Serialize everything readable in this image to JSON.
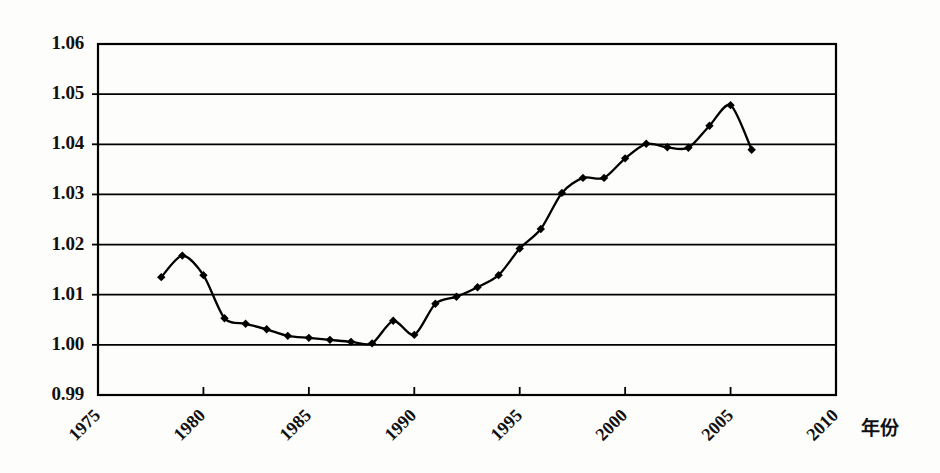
{
  "chart_data": {
    "type": "line",
    "title": "",
    "subtitle": "",
    "xlabel": "年份",
    "ylabel": "",
    "xlim": [
      1975,
      2010
    ],
    "ylim": [
      0.99,
      1.06
    ],
    "grid": true,
    "grid_axis": "y",
    "legend": null,
    "legend_position": "none",
    "marker": "diamond",
    "marker_color": "#000000",
    "line_color": "#000000",
    "x_tick_labels": [
      "1975",
      "1980",
      "1985",
      "1990",
      "1995",
      "2000",
      "2005",
      "2010"
    ],
    "x_ticks": [
      1975,
      1980,
      1985,
      1990,
      1995,
      2000,
      2005,
      2010
    ],
    "y_tick_labels": [
      "1.06",
      "1.05",
      "1.04",
      "1.03",
      "1.02",
      "1.01",
      "1.00",
      "0.99"
    ],
    "y_ticks": [
      1.06,
      1.05,
      1.04,
      1.03,
      1.02,
      1.01,
      1.0,
      0.99
    ],
    "x": [
      1978,
      1979,
      1980,
      1981,
      1982,
      1983,
      1984,
      1985,
      1986,
      1987,
      1988,
      1989,
      1990,
      1991,
      1992,
      1993,
      1994,
      1995,
      1996,
      1997,
      1998,
      1999,
      2000,
      2001,
      2002,
      2003,
      2004,
      2005,
      2006
    ],
    "values": [
      1.0135,
      1.0178,
      1.0139,
      1.0053,
      1.0042,
      1.0031,
      1.0018,
      1.0014,
      1.001,
      1.0006,
      1.0003,
      1.0048,
      1.002,
      1.0082,
      1.0096,
      1.0115,
      1.0139,
      1.0192,
      1.0231,
      1.0303,
      1.0333,
      1.0333,
      1.0372,
      1.0401,
      1.0394,
      1.0393,
      1.0437,
      1.0478,
      1.0389
    ],
    "annotations": []
  },
  "axes": {
    "frame_color": "#000000",
    "background": "#ffffff"
  }
}
